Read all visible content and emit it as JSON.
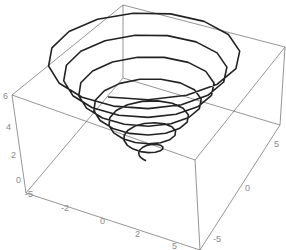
{
  "chart_data": {
    "type": "line3d",
    "title": "",
    "xlabel": "",
    "ylabel": "",
    "zlabel": "",
    "x_ticks": [
      "-5",
      "-2",
      "0",
      "2",
      "5"
    ],
    "y_ticks": [
      "-5",
      "0",
      "5"
    ],
    "z_ticks": [
      "0",
      "2",
      "4",
      "6"
    ],
    "xlim": [
      -6,
      6
    ],
    "ylim": [
      -6,
      6
    ],
    "zlim": [
      0,
      6
    ],
    "grid": false,
    "boxed": true,
    "series": [
      {
        "name": "spiral",
        "color": "#222222",
        "turns": 7,
        "param": "x = t cos t, y = t sin t, z = t/6 (approx)",
        "radius_range": [
          0,
          6.5
        ],
        "z_range": [
          0,
          6
        ]
      }
    ]
  },
  "axes": {
    "z_labels": [
      "6",
      "4",
      "2",
      "0"
    ],
    "x_labels": [
      "-5",
      "-2",
      "0",
      "2",
      "5"
    ],
    "y_labels": [
      "5",
      "0",
      "-5"
    ]
  }
}
